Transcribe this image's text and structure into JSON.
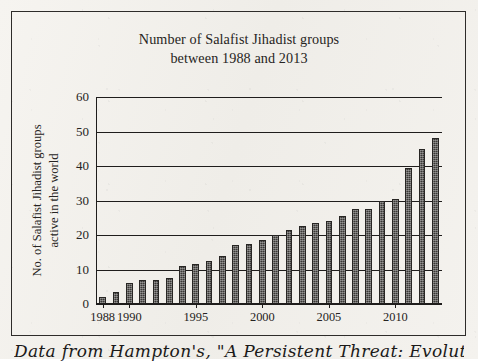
{
  "figure": {
    "title_line1": "Number of Salafist Jihadist groups",
    "title_line2": "between 1988 and 2013",
    "y_axis_title_line1": "No. of Salafist Jihadist groups",
    "y_axis_title_line2": "active in the world",
    "footer_note": "Data from Hampton's, \"A Persistent Threat: Evolution of"
  },
  "chart_data": {
    "type": "bar",
    "title": "Number of Salafist Jihadist groups between 1988 and 2013",
    "xlabel": "",
    "ylabel": "No. of Salafist Jihadist groups active in the world",
    "ylim": [
      0,
      60
    ],
    "ytick_values": [
      0,
      10,
      20,
      30,
      40,
      50,
      60
    ],
    "ytick_labels": [
      "0",
      "10",
      "20",
      "30",
      "40",
      "50",
      "60"
    ],
    "grid": "horizontal",
    "legend": "none",
    "bar_color": "#3a3836",
    "categories": [
      "1988",
      "1989",
      "1990",
      "1991",
      "1992",
      "1993",
      "1994",
      "1995",
      "1996",
      "1997",
      "1998",
      "1999",
      "2000",
      "2001",
      "2002",
      "2003",
      "2004",
      "2005",
      "2006",
      "2007",
      "2008",
      "2009",
      "2010",
      "2011",
      "2012",
      "2013"
    ],
    "values": [
      2,
      3.5,
      6,
      7,
      7,
      7.5,
      11,
      11.5,
      12.5,
      14,
      17,
      17.5,
      18.5,
      20,
      21.5,
      22.5,
      23.5,
      24,
      25.5,
      27.5,
      27.5,
      30,
      30.5,
      39.5,
      45,
      48
    ],
    "xtick_labels": [
      "1988",
      "1990",
      "1995",
      "2000",
      "2005",
      "2010"
    ],
    "xtick_categories": [
      "1988",
      "1990",
      "1995",
      "2000",
      "2005",
      "2010"
    ]
  }
}
